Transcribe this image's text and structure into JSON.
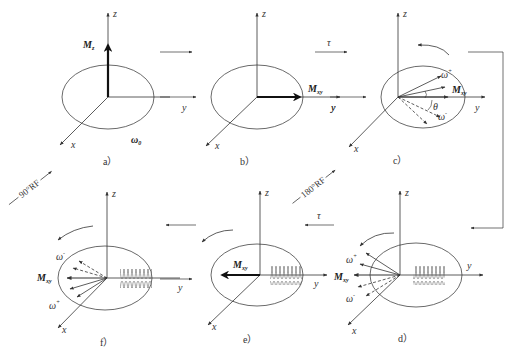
{
  "diagram": {
    "type": "spin-echo-sequence",
    "panels": [
      {
        "id": "a",
        "caption": "a）",
        "axes": {
          "x": "x",
          "y": "y",
          "z": "z"
        },
        "vector": "Mz",
        "vector_label": "M",
        "vector_sub": "z",
        "extra_label": "ω",
        "extra_sub": "0"
      },
      {
        "id": "b",
        "caption": "b）",
        "axes": {
          "x": "x",
          "y": "y",
          "z": "z"
        },
        "vector": "Mxy",
        "vector_label": "M",
        "vector_sub": "xy"
      },
      {
        "id": "c",
        "caption": "c）",
        "axes": {
          "x": "x",
          "y": "y",
          "z": "z"
        },
        "vector_label": "M",
        "vector_sub": "xy",
        "omega_plus": "ω",
        "omega_minus": "ω",
        "theta": "θ"
      },
      {
        "id": "d",
        "caption": "d）",
        "axes": {
          "x": "x",
          "y": "y",
          "z": "z"
        },
        "vector_label": "M",
        "vector_sub": "xy",
        "omega_plus": "ω",
        "omega_minus": "ω"
      },
      {
        "id": "e",
        "caption": "e）",
        "axes": {
          "x": "x",
          "y": "y",
          "z": "z"
        },
        "vector_label": "M",
        "vector_sub": "xy"
      },
      {
        "id": "f",
        "caption": "f）",
        "axes": {
          "x": "x",
          "y": "y",
          "z": "z"
        },
        "vector_label": "M",
        "vector_sub": "xy",
        "omega_plus": "ω",
        "omega_minus": "ω"
      }
    ],
    "transitions": {
      "rf90": "90°RF",
      "rf180": "180°RF",
      "tau": "τ",
      "plus": "+",
      "minus": "-"
    }
  }
}
